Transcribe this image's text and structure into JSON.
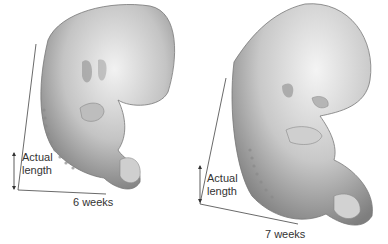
{
  "figure": {
    "panels": [
      {
        "id": "embryo-6-weeks",
        "caption": "6 weeks",
        "measure_label_line1": "Actual",
        "measure_label_line2": "length"
      },
      {
        "id": "embryo-7-weeks",
        "caption": "7 weeks",
        "measure_label_line1": "Actual",
        "measure_label_line2": "length"
      }
    ],
    "colors": {
      "background": "#ffffff",
      "embryo_light": "#e8e8e8",
      "embryo_mid": "#b5b5b5",
      "embryo_dark": "#6e6e6e",
      "text": "#333333"
    }
  }
}
